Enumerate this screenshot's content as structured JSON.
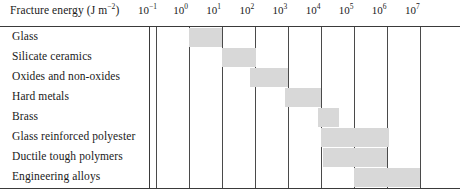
{
  "chart_data": {
    "type": "bar",
    "title_text": "Fracture energy (J m",
    "title_sup": "−2",
    "title_suffix": ")",
    "xlabel": "Fracture energy (J m⁻²)",
    "ylabel": "",
    "xscale": "log",
    "xlim": [
      -1,
      7
    ],
    "grid": true,
    "legend": "none",
    "orientation": "horizontal",
    "bar_color": "#d8d8d8",
    "tick_labels": [
      {
        "base": "10",
        "exp": "−1",
        "value": -1
      },
      {
        "base": "10",
        "exp": "0",
        "value": 0
      },
      {
        "base": "10",
        "exp": "1",
        "value": 1
      },
      {
        "base": "10",
        "exp": "2",
        "value": 2
      },
      {
        "base": "10",
        "exp": "3",
        "value": 3
      },
      {
        "base": "10",
        "exp": "4",
        "value": 4
      },
      {
        "base": "10",
        "exp": "5",
        "value": 5
      },
      {
        "base": "10",
        "exp": "6",
        "value": 6
      },
      {
        "base": "10",
        "exp": "7",
        "value": 7
      }
    ],
    "categories": [
      "Glass",
      "Silicate ceramics",
      "Oxides and non-oxides",
      "Hard metals",
      "Brass",
      "Glass reinforced polyester",
      "Ductile tough polymers",
      "Engineering alloys"
    ],
    "ranges": [
      {
        "label": "Glass",
        "start": 0.0,
        "end": 1.0
      },
      {
        "label": "Silicate ceramics",
        "start": 1.0,
        "end": 2.05
      },
      {
        "label": "Oxides and non-oxides",
        "start": 1.85,
        "end": 3.0
      },
      {
        "label": "Hard metals",
        "start": 2.9,
        "end": 4.0
      },
      {
        "label": "Brass",
        "start": 3.9,
        "end": 4.55
      },
      {
        "label": "Glass reinforced polyester",
        "start": 4.0,
        "end": 6.05
      },
      {
        "label": "Ductile tough polymers",
        "start": 4.05,
        "end": 6.0
      },
      {
        "label": "Engineering alloys",
        "start": 5.0,
        "end": 7.0
      }
    ]
  }
}
